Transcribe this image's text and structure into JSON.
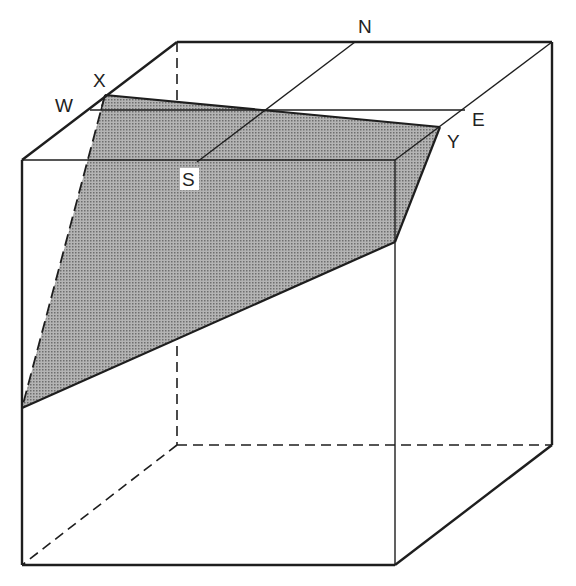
{
  "diagram": {
    "type": "block-diagram-dipping-plane",
    "colors": {
      "line": "#1e1e1e",
      "plane_fill": "#9a9a9a",
      "background": "#ffffff"
    },
    "labels": {
      "N": "N",
      "E": "E",
      "W": "W",
      "S": "S",
      "X": "X",
      "Y": "Y"
    },
    "cube_vertices": {
      "front_top_left": [
        22,
        160
      ],
      "front_top_right": [
        395,
        160
      ],
      "back_top_left": [
        177,
        42
      ],
      "back_top_right": [
        552,
        42
      ],
      "front_bottom_left": [
        22,
        565
      ],
      "front_bottom_right": [
        395,
        565
      ],
      "back_bottom_left": [
        177,
        445
      ],
      "back_bottom_right": [
        552,
        445
      ]
    },
    "plane_vertices": {
      "X": [
        105,
        95
      ],
      "Y": [
        440,
        127
      ],
      "front_right_lower": [
        395,
        242
      ],
      "front_left_lower": [
        22,
        408
      ]
    }
  }
}
